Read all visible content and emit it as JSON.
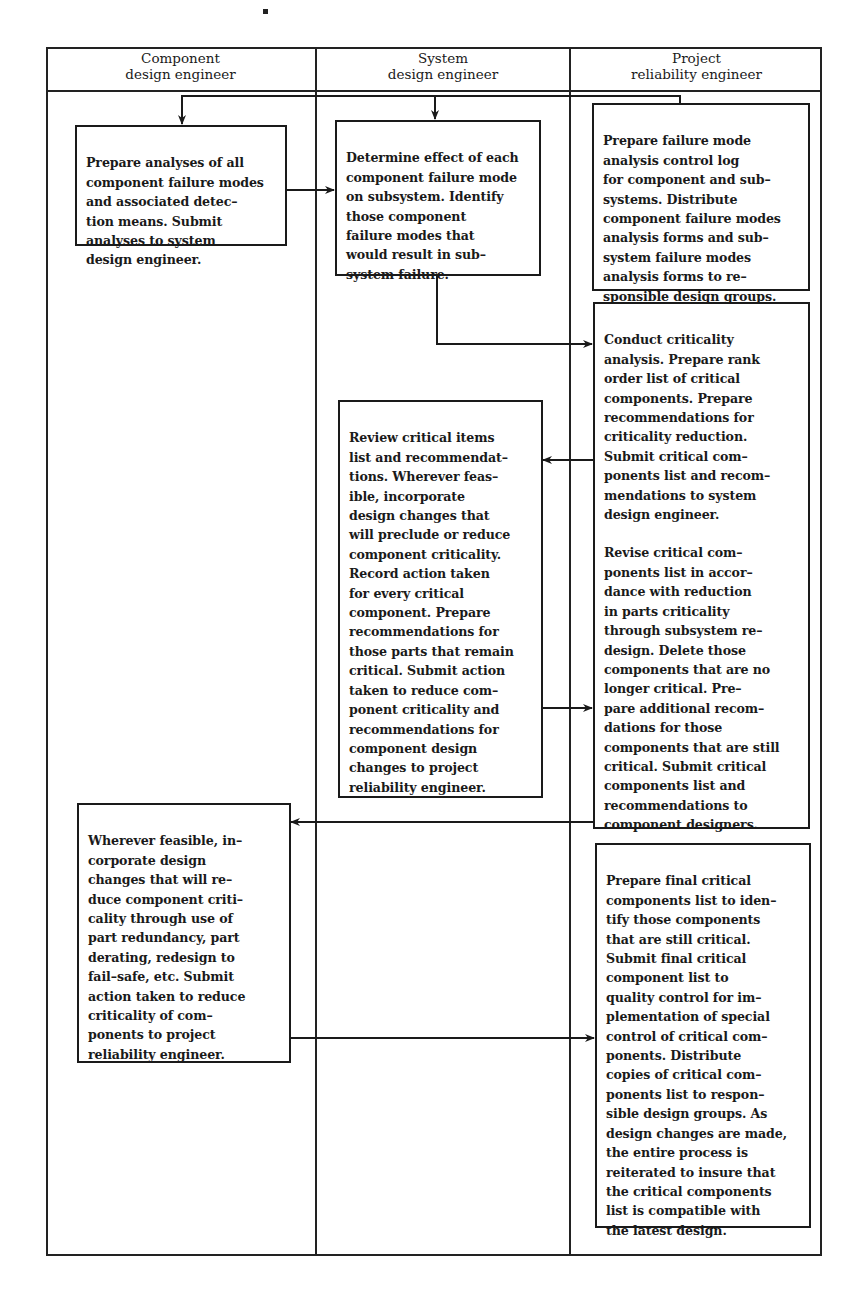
{
  "diagram": {
    "type": "swimlane-flowchart",
    "lanes": [
      {
        "id": "component",
        "title_line1": "Component",
        "title_line2": "design engineer"
      },
      {
        "id": "system",
        "title_line1": "System",
        "title_line2": "design engineer"
      },
      {
        "id": "reliability",
        "title_line1": "Project",
        "title_line2": "reliability engineer"
      }
    ],
    "steps": {
      "s1": {
        "lane": "component",
        "text": "Prepare analyses of all\ncomponent failure modes\nand associated detec–\ntion means. Submit\nanalyses to system\ndesign engineer."
      },
      "s2": {
        "lane": "system",
        "text": "Determine effect of each\ncomponent failure mode\non subsystem. Identify\nthose component\nfailure modes that\nwould result in sub–\nsystem failure."
      },
      "s3": {
        "lane": "reliability",
        "text": "Prepare failure mode\nanalysis control log\nfor component and sub–\nsystems. Distribute\ncomponent failure modes\nanalysis forms and sub–\nsystem failure modes\nanalysis forms to re–\nsponsible design groups."
      },
      "s4": {
        "lane": "reliability",
        "text": "Conduct criticality\nanalysis. Prepare rank\norder list of critical\ncomponents. Prepare\nrecommendations for\ncriticality reduction.\nSubmit critical com–\nponents list and recom–\nmendations to system\ndesign engineer.",
        "text2": "Revise critical com–\nponents list in accor–\ndance with reduction\nin parts criticality\nthrough subsystem re–\ndesign. Delete those\ncomponents that are no\nlonger critical. Pre–\npare additional recom–\ndations for those\ncomponents that are still\ncritical. Submit critical\ncomponents list and\nrecommendations to\ncomponent designers."
      },
      "s5": {
        "lane": "system",
        "text": "Review critical items\nlist and recommendat–\ntions. Wherever feas–\nible, incorporate\ndesign changes that\nwill preclude or reduce\ncomponent criticality.\nRecord action taken\nfor every critical\ncomponent. Prepare\nrecommendations for\nthose parts that remain\ncritical. Submit action\ntaken to reduce com–\nponent criticality and\nrecommendations for\ncomponent design\nchanges to project\nreliability engineer."
      },
      "s6": {
        "lane": "component",
        "text": "Wherever feasible, in–\ncorporate design\nchanges that will re–\nduce component criti–\ncality through use of\npart redundancy, part\nderating, redesign to\nfail–safe, etc. Submit\naction taken to reduce\ncriticality of com–\nponents to project\nreliability engineer."
      },
      "s7": {
        "lane": "reliability",
        "text": "Prepare final critical\ncomponents list to iden–\ntify those components\nthat are still critical.\nSubmit final critical\ncomponent list to\nquality control for im–\nplementation of special\ncontrol of critical com–\nponents. Distribute\ncopies of critical com–\nponents list to respon–\nsible design groups. As\ndesign changes are made,\nthe entire process is\nreiterated to insure that\nthe critical components\nlist is compatible with\nthe latest design."
      }
    },
    "arrows": [
      {
        "from": "s3",
        "to": "s1"
      },
      {
        "from": "s3",
        "to": "s2"
      },
      {
        "from": "s1",
        "to": "s2"
      },
      {
        "from": "s2",
        "to": "s4"
      },
      {
        "from": "s4",
        "to": "s5"
      },
      {
        "from": "s5",
        "to": "s4"
      },
      {
        "from": "s4",
        "to": "s6"
      },
      {
        "from": "s6",
        "to": "s7"
      }
    ],
    "colors": {
      "ink": "#1a1a1a",
      "background": "#ffffff"
    }
  }
}
